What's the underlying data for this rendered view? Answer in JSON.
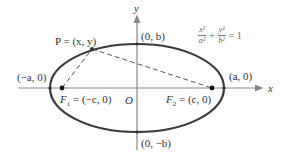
{
  "diagram": {
    "type": "ellipse-foci",
    "colors": {
      "curve": "#3a3a3a",
      "axis": "#888888",
      "dashed": "#555555",
      "point": "#111111",
      "text": "#333333"
    },
    "axes": {
      "x_label": "x",
      "y_label": "y",
      "origin_label": "O"
    },
    "labels": {
      "top_vertex": "(0, b)",
      "bottom_vertex": "(0, −b)",
      "left_vertex": "(−a, 0)",
      "right_vertex": "(a, 0)",
      "point_p": "P = (x, y)",
      "focus1_name": "F",
      "focus1_sub": "1",
      "focus1_value": " = (−c, 0)",
      "focus2_name": "F",
      "focus2_sub": "2",
      "focus2_value": " = (c, 0)"
    },
    "equation": {
      "term1_num": "x²",
      "term1_den": "a²",
      "plus": "+",
      "term2_num": "y²",
      "term2_den": "b²",
      "equals": "= 1"
    }
  }
}
